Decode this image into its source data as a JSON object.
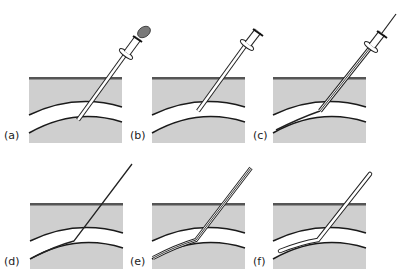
{
  "figure": {
    "panels": [
      {
        "label": "(a)",
        "content": "needle with syringe and cap inserted through tissue into vessel"
      },
      {
        "label": "(b)",
        "content": "syringe cap removed, needle in vessel"
      },
      {
        "label": "(c)",
        "content": "guidewire passed through needle into vessel"
      },
      {
        "label": "(d)",
        "content": "needle removed, guidewire remains in vessel"
      },
      {
        "label": "(e)",
        "content": "catheter/sheath threaded over guidewire"
      },
      {
        "label": "(f)",
        "content": "guidewire removed, catheter remains in vessel"
      }
    ],
    "colors": {
      "tissue": "#cfcfcf",
      "skin_line": "#555555",
      "vessel_lumen": "#ffffff",
      "vessel_wall": "#1a1a1a",
      "cap": "#7a7a7a"
    }
  }
}
